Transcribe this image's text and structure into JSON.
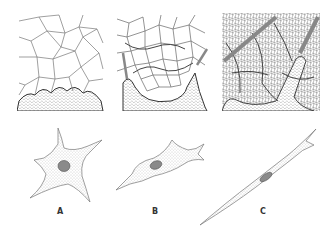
{
  "figure": {
    "top_panels": [
      {
        "id": "panel-1",
        "description": "large polygonal cells above a dense stippled base"
      },
      {
        "id": "panel-2",
        "description": "finer network of cells with fibers over a stippled base"
      },
      {
        "id": "panel-3",
        "description": "dense fibrous network with thick fibers and stippled projections"
      }
    ],
    "cells": [
      {
        "label": "A",
        "shape": "stellate"
      },
      {
        "label": "B",
        "shape": "elongated"
      },
      {
        "label": "C",
        "shape": "spindle"
      }
    ],
    "colors": {
      "line": "#555555",
      "nucleus": "#888888",
      "stipple": "#999999"
    }
  }
}
